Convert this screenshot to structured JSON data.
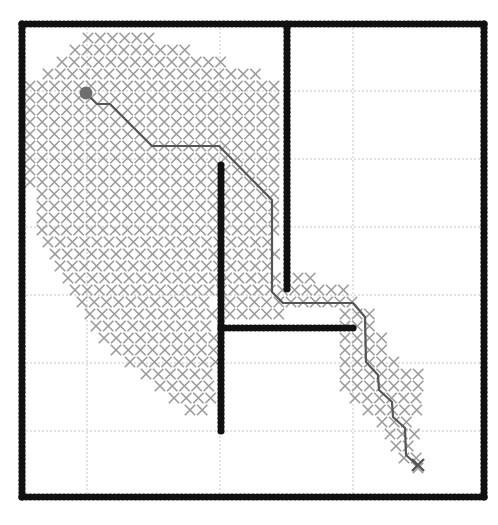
{
  "chart_data": {
    "type": "scatter",
    "title": "",
    "xlabel": "",
    "ylabel": "",
    "axes_px": {
      "left": 22,
      "right": 484,
      "top": 24,
      "bottom": 497
    },
    "xlim": [
      5,
      40
    ],
    "ylim": [
      5,
      40
    ],
    "grid": true,
    "grid_px": {
      "vertical": [
        87,
        220,
        353
      ],
      "horizontal": [
        91,
        159,
        227,
        295,
        363,
        431
      ]
    },
    "grid_values": {
      "x": [
        10,
        20,
        30
      ],
      "y": [
        35,
        30,
        25,
        20,
        15,
        10
      ]
    },
    "marker_pitch_px": 12.2,
    "start": {
      "label": "start",
      "px": [
        86,
        93
      ],
      "xy": [
        10,
        35
      ],
      "color": "#6e6e6e"
    },
    "goal": {
      "label": "goal",
      "px": [
        418,
        465
      ],
      "xy": [
        35,
        7.5
      ],
      "color": "#555555"
    },
    "obstacles": [
      {
        "name": "outer-boundary",
        "px_rect": [
          22,
          24,
          484,
          497
        ]
      },
      {
        "name": "wall-a",
        "px_from": [
          287,
          24
        ],
        "px_to": [
          287,
          289
        ],
        "xy_from": [
          25.5,
          40
        ],
        "xy_to": [
          25.5,
          20.4
        ]
      },
      {
        "name": "wall-b",
        "px_from": [
          221,
          165
        ],
        "px_to": [
          221,
          431
        ],
        "xy_from": [
          20,
          29.6
        ],
        "xy_to": [
          20,
          10
        ]
      },
      {
        "name": "wall-c",
        "px_from": [
          221,
          328
        ],
        "px_to": [
          353,
          328
        ],
        "xy_from": [
          20,
          17.6
        ],
        "xy_to": [
          30,
          17.6
        ]
      }
    ],
    "path_px": [
      [
        86,
        93
      ],
      [
        97,
        104
      ],
      [
        110,
        104
      ],
      [
        152,
        146
      ],
      [
        219,
        146
      ],
      [
        272,
        200
      ],
      [
        272,
        292
      ],
      [
        283,
        303
      ],
      [
        353,
        303
      ],
      [
        365,
        317
      ],
      [
        366,
        362
      ],
      [
        378,
        375
      ],
      [
        379,
        390
      ],
      [
        392,
        402
      ],
      [
        393,
        417
      ],
      [
        405,
        428
      ],
      [
        406,
        455
      ],
      [
        418,
        466
      ]
    ],
    "explored_rows_px": [
      {
        "y": 38,
        "spans": [
          [
            88,
            155
          ]
        ]
      },
      {
        "y": 50,
        "spans": [
          [
            75,
            195
          ]
        ]
      },
      {
        "y": 62,
        "spans": [
          [
            62,
            222
          ]
        ]
      },
      {
        "y": 74,
        "spans": [
          [
            48,
            262
          ]
        ]
      },
      {
        "y": 86,
        "spans": [
          [
            30,
            276
          ]
        ]
      },
      {
        "y": 98,
        "spans": [
          [
            30,
            276
          ]
        ]
      },
      {
        "y": 110,
        "spans": [
          [
            30,
            276
          ]
        ]
      },
      {
        "y": 122,
        "spans": [
          [
            30,
            276
          ]
        ]
      },
      {
        "y": 134,
        "spans": [
          [
            30,
            276
          ]
        ]
      },
      {
        "y": 146,
        "spans": [
          [
            30,
            276
          ]
        ]
      },
      {
        "y": 158,
        "spans": [
          [
            30,
            276
          ]
        ]
      },
      {
        "y": 170,
        "spans": [
          [
            30,
            276
          ]
        ]
      },
      {
        "y": 182,
        "spans": [
          [
            30,
            276
          ]
        ]
      },
      {
        "y": 194,
        "spans": [
          [
            42,
            276
          ]
        ]
      },
      {
        "y": 206,
        "spans": [
          [
            42,
            276
          ]
        ]
      },
      {
        "y": 218,
        "spans": [
          [
            42,
            276
          ]
        ]
      },
      {
        "y": 230,
        "spans": [
          [
            42,
            276
          ]
        ]
      },
      {
        "y": 242,
        "spans": [
          [
            48,
            276
          ]
        ]
      },
      {
        "y": 254,
        "spans": [
          [
            55,
            276
          ]
        ]
      },
      {
        "y": 266,
        "spans": [
          [
            60,
            276
          ]
        ]
      },
      {
        "y": 278,
        "spans": [
          [
            68,
            276
          ],
          [
            298,
            310
          ]
        ]
      },
      {
        "y": 290,
        "spans": [
          [
            75,
            345
          ]
        ]
      },
      {
        "y": 302,
        "spans": [
          [
            82,
            215
          ],
          [
            230,
            358
          ]
        ]
      },
      {
        "y": 314,
        "spans": [
          [
            90,
            215
          ],
          [
            230,
            280
          ],
          [
            345,
            372
          ]
        ]
      },
      {
        "y": 326,
        "spans": [
          [
            96,
            215
          ],
          [
            345,
            378
          ]
        ]
      },
      {
        "y": 338,
        "spans": [
          [
            104,
            215
          ],
          [
            345,
            386
          ]
        ]
      },
      {
        "y": 350,
        "spans": [
          [
            116,
            215
          ],
          [
            345,
            392
          ]
        ]
      },
      {
        "y": 362,
        "spans": [
          [
            130,
            215
          ],
          [
            345,
            404
          ]
        ]
      },
      {
        "y": 374,
        "spans": [
          [
            146,
            215
          ],
          [
            345,
            418
          ]
        ]
      },
      {
        "y": 386,
        "spans": [
          [
            160,
            215
          ],
          [
            345,
            418
          ]
        ]
      },
      {
        "y": 398,
        "spans": [
          [
            174,
            215
          ],
          [
            355,
            418
          ]
        ]
      },
      {
        "y": 410,
        "spans": [
          [
            190,
            212
          ],
          [
            368,
            418
          ]
        ]
      },
      {
        "y": 422,
        "spans": [
          [
            382,
            418
          ]
        ]
      },
      {
        "y": 434,
        "spans": [
          [
            390,
            418
          ]
        ]
      },
      {
        "y": 446,
        "spans": [
          [
            396,
            418
          ]
        ]
      },
      {
        "y": 458,
        "spans": [
          [
            404,
            418
          ]
        ]
      },
      {
        "y": 468,
        "spans": [
          [
            418,
            418
          ]
        ]
      }
    ],
    "colors": {
      "explored": "#9a9a9a",
      "wall": "#111111",
      "path": "#555555",
      "grid": "#c8c8c8",
      "background": "#ffffff"
    }
  }
}
